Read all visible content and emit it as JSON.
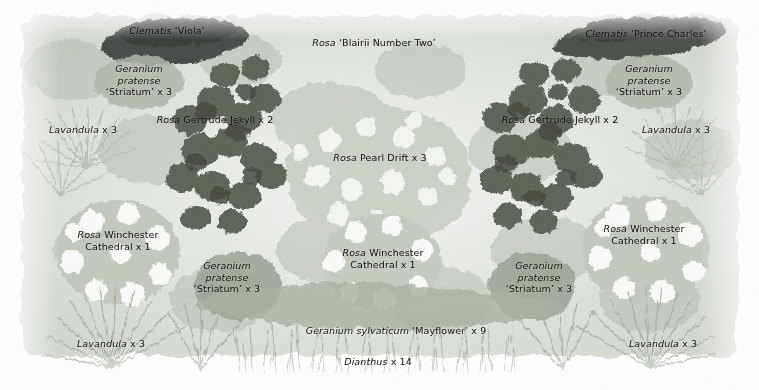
{
  "plan": {
    "title": "Garden planting plan",
    "medium": "watercolour illustration",
    "palette": {
      "background": "#ffffff",
      "label_text": "#14120f",
      "clematis_dark": "#3f4440",
      "rose_mid": "#8d8f8b",
      "foliage_light": "#c9cdc6",
      "highlight": "#f2f4f1"
    },
    "labels": [
      {
        "id": "clematis-viola",
        "lines": [
          [
            {
              "t": "Clematis",
              "style": "italic"
            },
            {
              "t": " ‘Viola’",
              "style": "roman"
            }
          ]
        ],
        "x": 167,
        "y": 31,
        "tone": "on-dark"
      },
      {
        "id": "rosa-blairii-number-two",
        "lines": [
          [
            {
              "t": "Rosa",
              "style": "italic"
            },
            {
              "t": " ‘Blairii Number Two’",
              "style": "roman"
            }
          ]
        ],
        "x": 374,
        "y": 43,
        "tone": "on-mid"
      },
      {
        "id": "clematis-prince-charles",
        "lines": [
          [
            {
              "t": "Clematis",
              "style": "italic"
            },
            {
              "t": " ‘Prince Charles’",
              "style": "roman"
            }
          ]
        ],
        "x": 646,
        "y": 34,
        "tone": "on-dark"
      },
      {
        "id": "geranium-pratense-striatum-top-left",
        "lines": [
          [
            {
              "t": "Geranium",
              "style": "italic"
            }
          ],
          [
            {
              "t": "pratense",
              "style": "italic"
            }
          ],
          [
            {
              "t": "‘Striatum’ x 3",
              "style": "roman"
            }
          ]
        ],
        "x": 139,
        "y": 80,
        "tone": "on-mid"
      },
      {
        "id": "geranium-pratense-striatum-top-right",
        "lines": [
          [
            {
              "t": "Geranium",
              "style": "italic"
            }
          ],
          [
            {
              "t": "pratense",
              "style": "italic"
            }
          ],
          [
            {
              "t": "‘Striatum’ x 3",
              "style": "roman"
            }
          ]
        ],
        "x": 649,
        "y": 80,
        "tone": "on-mid"
      },
      {
        "id": "rosa-gertrude-jekyll-left",
        "lines": [
          [
            {
              "t": "Rosa",
              "style": "italic"
            },
            {
              "t": " Gertrude Jekyll x 2",
              "style": "roman"
            }
          ]
        ],
        "x": 215,
        "y": 120,
        "tone": "on-dark"
      },
      {
        "id": "rosa-gertrude-jekyll-right",
        "lines": [
          [
            {
              "t": "Rosa",
              "style": "italic"
            },
            {
              "t": " Gertrude Jekyll x 2",
              "style": "roman"
            }
          ]
        ],
        "x": 560,
        "y": 120,
        "tone": "on-dark"
      },
      {
        "id": "lavandula-top-left",
        "lines": [
          [
            {
              "t": "Lavandula",
              "style": "italic"
            },
            {
              "t": " x 3",
              "style": "roman"
            }
          ]
        ],
        "x": 83,
        "y": 130,
        "tone": "plain"
      },
      {
        "id": "lavandula-top-right",
        "lines": [
          [
            {
              "t": "Lavandula",
              "style": "italic"
            },
            {
              "t": " x 3",
              "style": "roman"
            }
          ]
        ],
        "x": 676,
        "y": 130,
        "tone": "plain"
      },
      {
        "id": "rosa-pearl-drift",
        "lines": [
          [
            {
              "t": "Rosa",
              "style": "italic"
            },
            {
              "t": " Pearl Drift x 3",
              "style": "roman"
            }
          ]
        ],
        "x": 380,
        "y": 158,
        "tone": "on-mid"
      },
      {
        "id": "rosa-winchester-cathedral-left",
        "lines": [
          [
            {
              "t": "Rosa",
              "style": "italic"
            },
            {
              "t": " Winchester",
              "style": "roman"
            }
          ],
          [
            {
              "t": "Cathedral x 1",
              "style": "roman"
            }
          ]
        ],
        "x": 118,
        "y": 240,
        "tone": "on-mid"
      },
      {
        "id": "rosa-winchester-cathedral-right",
        "lines": [
          [
            {
              "t": "Rosa",
              "style": "italic"
            },
            {
              "t": " Winchester",
              "style": "roman"
            }
          ],
          [
            {
              "t": "Cathedral x 1",
              "style": "roman"
            }
          ]
        ],
        "x": 644,
        "y": 234,
        "tone": "on-mid"
      },
      {
        "id": "rosa-winchester-cathedral-centre",
        "lines": [
          [
            {
              "t": "Rosa",
              "style": "italic"
            },
            {
              "t": " Winchester",
              "style": "roman"
            }
          ],
          [
            {
              "t": "Cathedral x 1",
              "style": "roman"
            }
          ]
        ],
        "x": 383,
        "y": 258,
        "tone": "on-mid"
      },
      {
        "id": "geranium-pratense-striatum-lower-left",
        "lines": [
          [
            {
              "t": "Geranium",
              "style": "italic"
            }
          ],
          [
            {
              "t": "pratense",
              "style": "italic"
            }
          ],
          [
            {
              "t": "‘Striatum’ x 3",
              "style": "roman"
            }
          ]
        ],
        "x": 227,
        "y": 277,
        "tone": "on-mid"
      },
      {
        "id": "geranium-pratense-striatum-lower-right",
        "lines": [
          [
            {
              "t": "Geranium",
              "style": "italic"
            }
          ],
          [
            {
              "t": "pratense",
              "style": "italic"
            }
          ],
          [
            {
              "t": "‘Striatum’ x 3",
              "style": "roman"
            }
          ]
        ],
        "x": 539,
        "y": 277,
        "tone": "on-mid"
      },
      {
        "id": "geranium-sylvaticum-mayflower",
        "lines": [
          [
            {
              "t": "Geranium sylvaticum",
              "style": "italic"
            },
            {
              "t": " ‘Mayflower’ x 9",
              "style": "roman"
            }
          ]
        ],
        "x": 396,
        "y": 331,
        "tone": "plain"
      },
      {
        "id": "lavandula-bottom-left",
        "lines": [
          [
            {
              "t": "Lavandula",
              "style": "italic"
            },
            {
              "t": " x 3",
              "style": "roman"
            }
          ]
        ],
        "x": 111,
        "y": 344,
        "tone": "plain"
      },
      {
        "id": "lavandula-bottom-right",
        "lines": [
          [
            {
              "t": "Lavandula",
              "style": "italic"
            },
            {
              "t": " x 3",
              "style": "roman"
            }
          ]
        ],
        "x": 663,
        "y": 344,
        "tone": "plain"
      },
      {
        "id": "dianthus",
        "lines": [
          [
            {
              "t": "Dianthus",
              "style": "italic"
            },
            {
              "t": " x 14",
              "style": "roman"
            }
          ]
        ],
        "x": 378,
        "y": 362,
        "tone": "plain"
      }
    ]
  }
}
